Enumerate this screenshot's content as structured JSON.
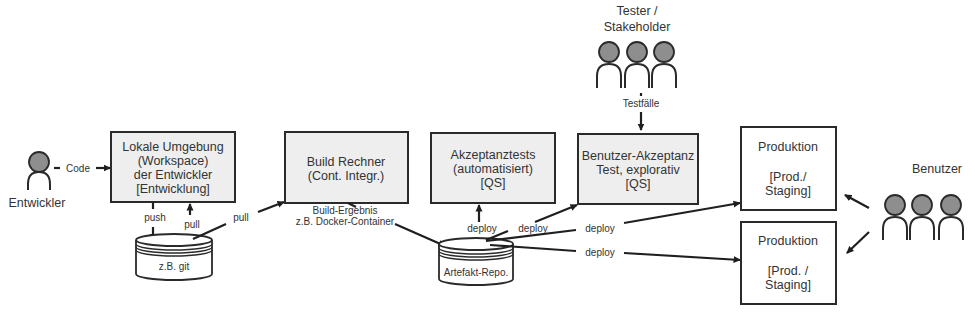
{
  "actors": {
    "developer": {
      "label": "Entwickler"
    },
    "testers": {
      "label_line1": "Tester /",
      "label_line2": "Stakeholder"
    },
    "users": {
      "label": "Benutzer"
    }
  },
  "boxes": {
    "local_env": {
      "lines": [
        "Lokale Umgebung",
        "(Workspace)",
        "der Entwickler",
        "[Entwicklung]"
      ]
    },
    "build": {
      "lines": [
        "Build Rechner",
        "(Cont. Integr.)"
      ]
    },
    "acceptance_auto": {
      "lines": [
        "Akzeptanztests",
        "(automatisiert)",
        "[QS]"
      ]
    },
    "user_acceptance": {
      "lines": [
        "Benutzer-Akzeptanz",
        "Test, explorativ",
        "[QS]"
      ]
    },
    "production_1": {
      "lines": [
        "Produktion",
        "[Prod./",
        "Staging]"
      ]
    },
    "production_2": {
      "lines": [
        "Produktion",
        "[Prod. /",
        "Staging]"
      ]
    }
  },
  "repos": {
    "git": {
      "label": "z.B. git"
    },
    "artifact": {
      "label": "Artefakt-Repo."
    }
  },
  "edges": {
    "code": "Code",
    "push": "push",
    "pull_local": "pull",
    "pull_build": "pull",
    "build_result_line1": "Build-Ergebnis",
    "build_result_line2": "z.B. Docker-Container",
    "deploy_auto": "deploy",
    "deploy_uat": "deploy",
    "deploy_prod1": "deploy",
    "deploy_prod2": "deploy",
    "testcases": "Testfälle"
  },
  "colors": {
    "box_fill": "#eeeeee",
    "stroke": "#2a2a2a",
    "head_fill": "#8e8e8e",
    "text": "#333333"
  }
}
